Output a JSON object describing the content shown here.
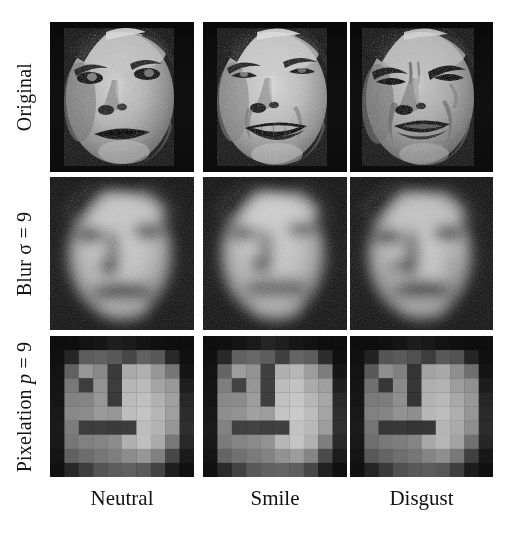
{
  "figure": {
    "background_color": "#ffffff",
    "text_color": "#121212",
    "grid_rows": 3,
    "grid_cols": 3
  },
  "row_labels": [
    {
      "id": "original",
      "text": "Original",
      "prefix": "Original",
      "symbol": "",
      "equals": "",
      "value": ""
    },
    {
      "id": "blur",
      "text": "Blur σ = 9",
      "prefix": "Blur ",
      "symbol": "σ",
      "equals": " = ",
      "value": "9"
    },
    {
      "id": "pixelation",
      "text": "Pixelation p = 9",
      "prefix": "Pixelation ",
      "symbol": "p",
      "equals": " = ",
      "value": "9"
    }
  ],
  "col_labels": [
    {
      "id": "neutral",
      "text": "Neutral"
    },
    {
      "id": "smile",
      "text": "Smile"
    },
    {
      "id": "disgust",
      "text": "Disgust"
    }
  ],
  "cells": [
    {
      "row": "Original",
      "col": "Neutral",
      "expression": "neutral",
      "filter": "none"
    },
    {
      "row": "Original",
      "col": "Smile",
      "expression": "smile",
      "filter": "none"
    },
    {
      "row": "Original",
      "col": "Disgust",
      "expression": "disgust",
      "filter": "none"
    },
    {
      "row": "Blur σ = 9",
      "col": "Neutral",
      "expression": "neutral",
      "filter": "blur",
      "sigma": 9
    },
    {
      "row": "Blur σ = 9",
      "col": "Smile",
      "expression": "smile",
      "filter": "blur",
      "sigma": 9
    },
    {
      "row": "Blur σ = 9",
      "col": "Disgust",
      "expression": "disgust",
      "filter": "blur",
      "sigma": 9
    },
    {
      "row": "Pixelation p = 9",
      "col": "Neutral",
      "expression": "neutral",
      "filter": "pixelation",
      "p": 9
    },
    {
      "row": "Pixelation p = 9",
      "col": "Smile",
      "expression": "smile",
      "filter": "pixelation",
      "p": 9
    },
    {
      "row": "Pixelation p = 9",
      "col": "Disgust",
      "expression": "disgust",
      "filter": "pixelation",
      "p": 9
    }
  ],
  "pixelation_blocks": {
    "grid": 10,
    "neutral": [
      [
        14,
        14,
        18,
        22,
        30,
        26,
        20,
        16,
        14,
        14
      ],
      [
        16,
        38,
        92,
        96,
        88,
        70,
        96,
        88,
        40,
        16
      ],
      [
        18,
        96,
        150,
        136,
        58,
        170,
        176,
        150,
        118,
        20
      ],
      [
        20,
        120,
        60,
        146,
        60,
        182,
        186,
        164,
        152,
        30
      ],
      [
        22,
        130,
        132,
        150,
        58,
        186,
        192,
        176,
        160,
        40
      ],
      [
        24,
        136,
        140,
        154,
        150,
        190,
        196,
        182,
        158,
        44
      ],
      [
        26,
        124,
        60,
        62,
        58,
        60,
        188,
        178,
        150,
        46
      ],
      [
        24,
        118,
        128,
        132,
        140,
        176,
        190,
        170,
        120,
        40
      ],
      [
        20,
        96,
        108,
        118,
        126,
        140,
        150,
        128,
        70,
        26
      ],
      [
        16,
        40,
        62,
        84,
        92,
        96,
        90,
        66,
        30,
        16
      ]
    ],
    "smile": [
      [
        14,
        16,
        20,
        26,
        36,
        30,
        22,
        18,
        14,
        14
      ],
      [
        16,
        40,
        96,
        104,
        92,
        64,
        100,
        92,
        44,
        16
      ],
      [
        18,
        100,
        156,
        146,
        64,
        176,
        182,
        156,
        124,
        22
      ],
      [
        20,
        126,
        66,
        150,
        64,
        188,
        194,
        170,
        158,
        32
      ],
      [
        22,
        136,
        138,
        156,
        62,
        192,
        198,
        182,
        166,
        42
      ],
      [
        24,
        142,
        146,
        160,
        156,
        196,
        202,
        188,
        164,
        46
      ],
      [
        26,
        130,
        64,
        66,
        62,
        64,
        194,
        184,
        156,
        48
      ],
      [
        24,
        122,
        132,
        138,
        146,
        182,
        196,
        176,
        126,
        42
      ],
      [
        20,
        100,
        112,
        122,
        130,
        146,
        156,
        132,
        74,
        28
      ],
      [
        16,
        42,
        66,
        88,
        96,
        100,
        94,
        70,
        32,
        16
      ]
    ],
    "disgust": [
      [
        14,
        14,
        16,
        20,
        28,
        24,
        18,
        16,
        14,
        14
      ],
      [
        16,
        34,
        84,
        90,
        80,
        60,
        88,
        82,
        36,
        16
      ],
      [
        18,
        88,
        142,
        128,
        52,
        162,
        168,
        142,
        110,
        20
      ],
      [
        20,
        112,
        54,
        138,
        54,
        174,
        178,
        156,
        144,
        28
      ],
      [
        22,
        122,
        124,
        142,
        52,
        178,
        184,
        168,
        152,
        38
      ],
      [
        24,
        128,
        132,
        146,
        142,
        182,
        188,
        174,
        150,
        42
      ],
      [
        26,
        116,
        54,
        56,
        52,
        54,
        180,
        170,
        142,
        44
      ],
      [
        24,
        110,
        120,
        124,
        132,
        168,
        182,
        162,
        112,
        38
      ],
      [
        20,
        88,
        100,
        110,
        118,
        132,
        142,
        120,
        64,
        24
      ],
      [
        16,
        36,
        58,
        80,
        88,
        92,
        86,
        62,
        28,
        16
      ]
    ]
  }
}
